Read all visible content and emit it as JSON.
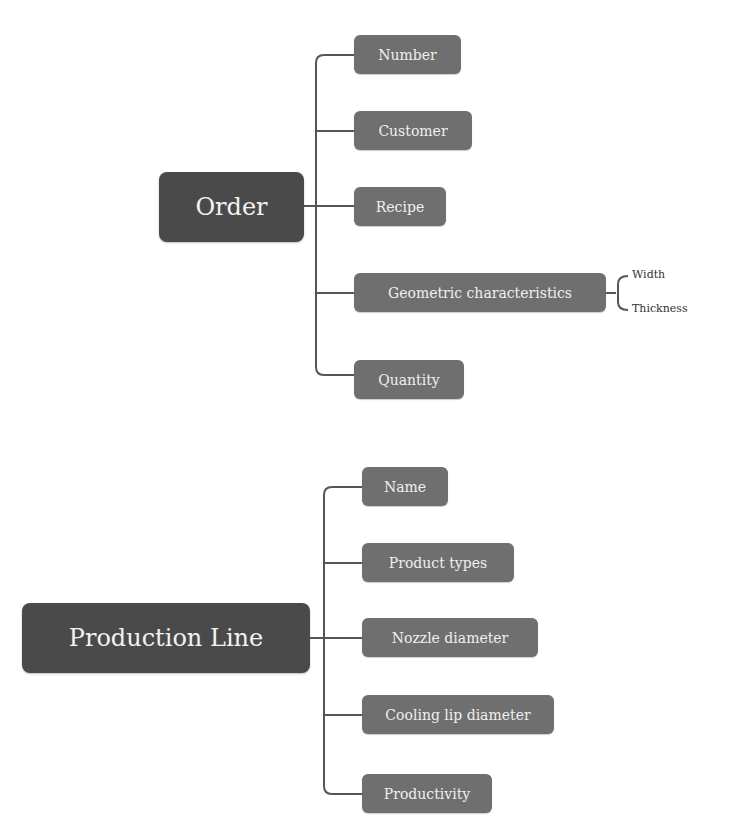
{
  "diagrams": [
    {
      "root": "Order",
      "children": [
        "Number",
        "Customer",
        "Recipe",
        "Geometric characteristics",
        "Quantity"
      ],
      "sub": {
        "parent": "Geometric characteristics",
        "children": [
          "Width",
          "Thickness"
        ]
      }
    },
    {
      "root": "Production Line",
      "children": [
        "Name",
        "Product types",
        "Nozzle diameter",
        "Cooling lip diameter",
        "Productivity"
      ]
    }
  ],
  "colors": {
    "root_fill": "#4a4a4a",
    "child_fill": "#6f6f6f",
    "connector": "#555555"
  }
}
